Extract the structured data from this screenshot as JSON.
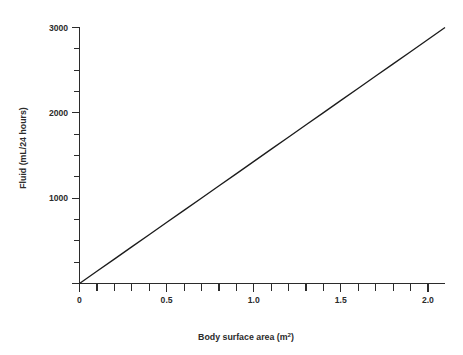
{
  "chart_data": {
    "type": "line",
    "title": "",
    "xlabel": "Body  surface area (m",
    "xlabel_sup": "2",
    "xlabel_tail": ")",
    "xlabel_full": "Body  surface area (m2)",
    "ylabel": "Fluid (mL/24 hours)",
    "xlim": [
      0,
      2.1
    ],
    "ylim": [
      0,
      3100
    ],
    "grid": false,
    "legend": null,
    "x_major_ticks": [
      0,
      0.5,
      1.0,
      1.5,
      2.0
    ],
    "x_major_tick_labels": [
      "0",
      "0.5",
      "1.0",
      "1.5",
      "2.0"
    ],
    "x_minor_ticks": [
      0.1,
      0.2,
      0.3,
      0.4,
      0.6,
      0.7,
      0.8,
      0.9,
      1.1,
      1.2,
      1.3,
      1.4,
      1.6,
      1.7,
      1.8,
      1.9,
      2.1
    ],
    "x_tick_interval": 0.1,
    "y_major_ticks": [
      0,
      1000,
      2000,
      3000
    ],
    "y_major_tick_labels": [
      "",
      "1000",
      "2000",
      "3000"
    ],
    "y_minor_ticks": [
      250,
      500,
      750,
      1250,
      1500,
      1750,
      2250,
      2500,
      2750
    ],
    "y_tick_interval": 250,
    "series": [
      {
        "name": "Maintenance fluid requirement",
        "slope_ml_per_m2": 1476,
        "intercept": 0,
        "x": [
          0,
          0.1,
          0.2,
          0.3,
          0.4,
          0.5,
          0.6,
          0.7,
          0.8,
          0.9,
          1.0,
          1.1,
          1.2,
          1.3,
          1.4,
          1.5,
          1.6,
          1.7,
          1.8,
          1.9,
          2.0,
          2.1
        ],
        "values": [
          0,
          148,
          295,
          443,
          590,
          738,
          886,
          1033,
          1181,
          1328,
          1476,
          1624,
          1771,
          1919,
          2066,
          2214,
          2362,
          2509,
          2657,
          2804,
          2952,
          3100
        ]
      }
    ],
    "line_color": "#1c1c1c",
    "axis_color": "#2b2b2b",
    "background_color": "#ffffff"
  }
}
